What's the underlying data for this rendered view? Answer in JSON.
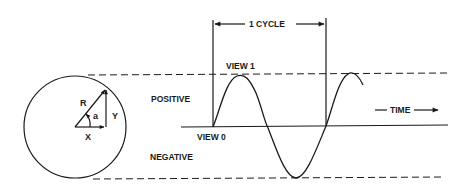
{
  "diagram": {
    "labels": {
      "cycle": "1 CYCLE",
      "view1": "VIEW 1",
      "view0": "VIEW 0",
      "positive": "POSITIVE",
      "negative": "NEGATIVE",
      "time": "TIME"
    },
    "vector_labels": {
      "radius": "R",
      "angle": "a",
      "y": "Y",
      "x": "X"
    },
    "colors": {
      "stroke": "#1a1a1a",
      "background": "#ffffff"
    }
  }
}
